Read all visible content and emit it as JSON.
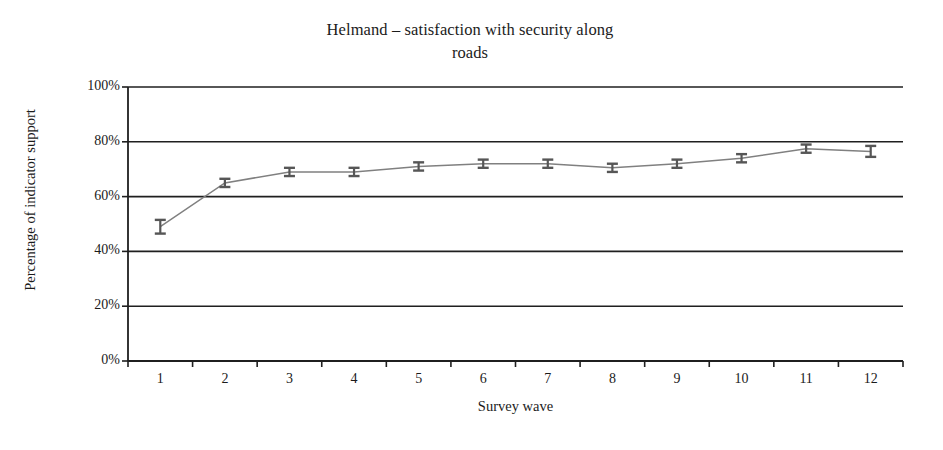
{
  "chart_data": {
    "type": "line",
    "title": "Helmand – satisfaction with security along roads",
    "title_lines": [
      "Helmand – satisfaction with security along",
      "roads"
    ],
    "xlabel": "Survey wave",
    "ylabel": "Percentage of indicator support",
    "x": [
      1,
      2,
      3,
      4,
      5,
      6,
      7,
      8,
      9,
      10,
      11,
      12
    ],
    "categories": [
      "1",
      "2",
      "3",
      "4",
      "5",
      "6",
      "7",
      "8",
      "9",
      "10",
      "11",
      "12"
    ],
    "values": [
      49,
      65,
      69,
      69,
      71,
      72,
      72,
      70.5,
      72,
      74,
      77.5,
      76.5
    ],
    "error_low": [
      46.5,
      63.5,
      67.5,
      67.5,
      69.5,
      70.5,
      70.5,
      69,
      70.5,
      72.5,
      76,
      74.5
    ],
    "error_high": [
      51.5,
      66.5,
      70.5,
      70.5,
      72.5,
      73.5,
      73.5,
      72,
      73.5,
      75.5,
      79,
      78.5
    ],
    "series": [
      {
        "name": "Percentage of indicator support",
        "values": [
          49,
          65,
          69,
          69,
          71,
          72,
          72,
          70.5,
          72,
          74,
          77.5,
          76.5
        ]
      }
    ],
    "ylim": [
      0,
      100
    ],
    "yticks": [
      0,
      20,
      40,
      60,
      80,
      100
    ],
    "ytick_labels": [
      "0%",
      "20%",
      "40%",
      "60%",
      "80%",
      "100%"
    ],
    "xlim": [
      0.5,
      12.5
    ],
    "grid": "horizontal",
    "legend": "none",
    "marker": "error-bar-ibeam",
    "line_color": "#808080",
    "marker_color": "#565656",
    "axis_color": "#1f1f1f",
    "grid_color": "#1f1f1f",
    "background": "#ffffff"
  }
}
